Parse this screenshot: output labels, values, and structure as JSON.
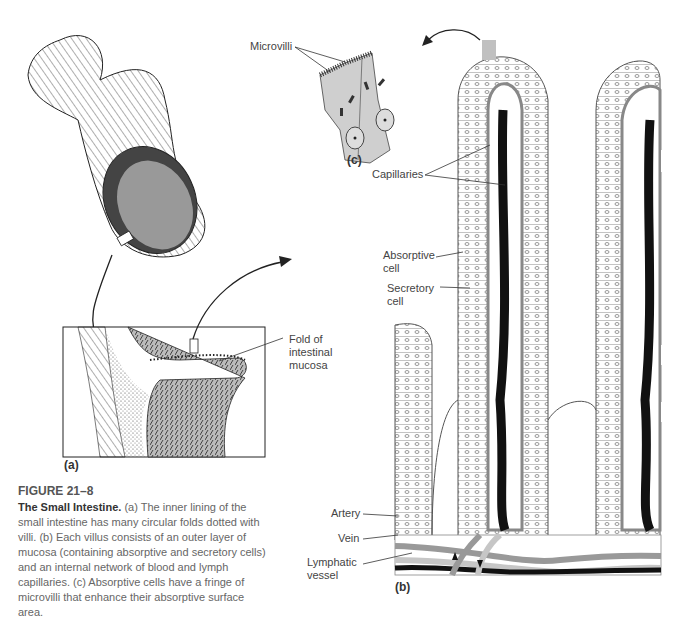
{
  "figure": {
    "number": "FIGURE 21–8",
    "title": "The Small Intestine.",
    "caption": "(a) The inner lining of the small intestine has many circular folds dotted with villi. (b) Each villus consists of an outer layer of mucosa (containing absorptive and secretory cells) and an internal network of blood and lymph capillaries. (c) Absorptive cells have a fringe of microvilli that enhance their absorptive surface area."
  },
  "panels": {
    "a": "(a)",
    "b": "(b)",
    "c": "(c)"
  },
  "labels": {
    "microvilli": "Microvilli",
    "capillaries": "Capillaries",
    "absorptive_cell_1": "Absorptive",
    "absorptive_cell_2": "cell",
    "secretory_cell_1": "Secretory",
    "secretory_cell_2": "cell",
    "fold_1": "Fold of",
    "fold_2": "intestinal",
    "fold_3": "mucosa",
    "artery": "Artery",
    "vein": "Vein",
    "lymphatic_1": "Lymphatic",
    "lymphatic_2": "vessel"
  },
  "colors": {
    "ink": "#222222",
    "cell_gray": "#c8c8c8",
    "vessel_gray": "#a8a8a8",
    "lymph_black": "#111111"
  }
}
